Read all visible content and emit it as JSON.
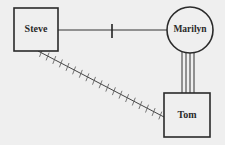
{
  "diagram": {
    "type": "genogram-relationship",
    "background": "#efefef",
    "line_color": "#333333",
    "nodes": [
      {
        "id": "steve",
        "label": "Steve",
        "shape": "square",
        "x": 14,
        "y": 8,
        "w": 44,
        "h": 43
      },
      {
        "id": "marilyn",
        "label": "Marilyn",
        "shape": "circle",
        "cx": 190,
        "cy": 30,
        "r": 23
      },
      {
        "id": "tom",
        "label": "Tom",
        "shape": "square",
        "x": 164,
        "y": 93,
        "w": 46,
        "h": 44
      }
    ],
    "edges": [
      {
        "from": "steve",
        "to": "marilyn",
        "style": "single-line-with-break",
        "meaning": "cutoff"
      },
      {
        "from": "marilyn",
        "to": "tom",
        "style": "quadruple-line",
        "meaning": "very close / fused"
      },
      {
        "from": "steve",
        "to": "tom",
        "style": "hatched-line",
        "meaning": "hostile / conflict"
      }
    ]
  }
}
